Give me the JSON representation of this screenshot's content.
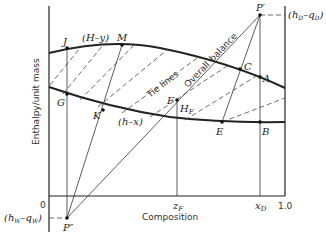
{
  "diagram": {
    "axes": {
      "ylabel": "Enthalpy/unit mass",
      "xlabel": "Composition",
      "x_ticks": [
        "0",
        "z_F",
        "x_D",
        "1.0"
      ],
      "zero_label": "0"
    },
    "curves": {
      "upper": "(H–y)",
      "lower": "(h–x)"
    },
    "labels": {
      "tie_lines": "Tie lines",
      "overall": "Overall",
      "balance": "balance",
      "hd_qd": "(h_D–q_D)",
      "hw_qw": "(h_W–q_W)",
      "hf": "H_F"
    },
    "points": {
      "J": "J",
      "M": "M",
      "G": "G",
      "K": "K",
      "F": "F",
      "C": "C",
      "A": "A",
      "E": "E",
      "B": "B",
      "P_prime": "P′",
      "P_double_prime": "P″"
    },
    "tick_text": {
      "zF_main": "z",
      "zF_sub": "F",
      "xD_main": "x",
      "xD_sub": "D",
      "one": "1.0"
    }
  }
}
